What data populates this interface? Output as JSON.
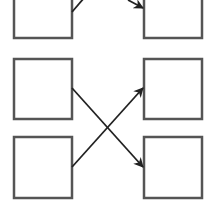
{
  "diagram": {
    "colors": {
      "stroke": "#555555",
      "fill": "#ffffff",
      "arrow": "#222222",
      "background": "#ffffff"
    },
    "boxes": [
      {
        "id": "top-left",
        "x": 14,
        "y": -20,
        "w": 58,
        "h": 58
      },
      {
        "id": "top-right",
        "x": 144,
        "y": -20,
        "w": 58,
        "h": 58
      },
      {
        "id": "middle-left",
        "x": 14,
        "y": 59,
        "w": 58,
        "h": 60
      },
      {
        "id": "middle-right",
        "x": 144,
        "y": 59,
        "w": 58,
        "h": 60
      },
      {
        "id": "bottom-left",
        "x": 14,
        "y": 137,
        "w": 58,
        "h": 61
      },
      {
        "id": "bottom-right",
        "x": 144,
        "y": 137,
        "w": 58,
        "h": 61
      }
    ],
    "arrows": [
      {
        "id": "top-left-out",
        "from": [
          72,
          12
        ],
        "to": [
          84,
          -2
        ],
        "head": false
      },
      {
        "id": "top-right-in",
        "from": [
          128,
          0
        ],
        "to": [
          143,
          8
        ],
        "head": true
      },
      {
        "id": "middle-left-to-bottom-right",
        "from": [
          72,
          88
        ],
        "to": [
          143,
          167
        ],
        "head": true
      },
      {
        "id": "bottom-left-to-middle-right",
        "from": [
          72,
          167
        ],
        "to": [
          143,
          88
        ],
        "head": true
      }
    ]
  }
}
